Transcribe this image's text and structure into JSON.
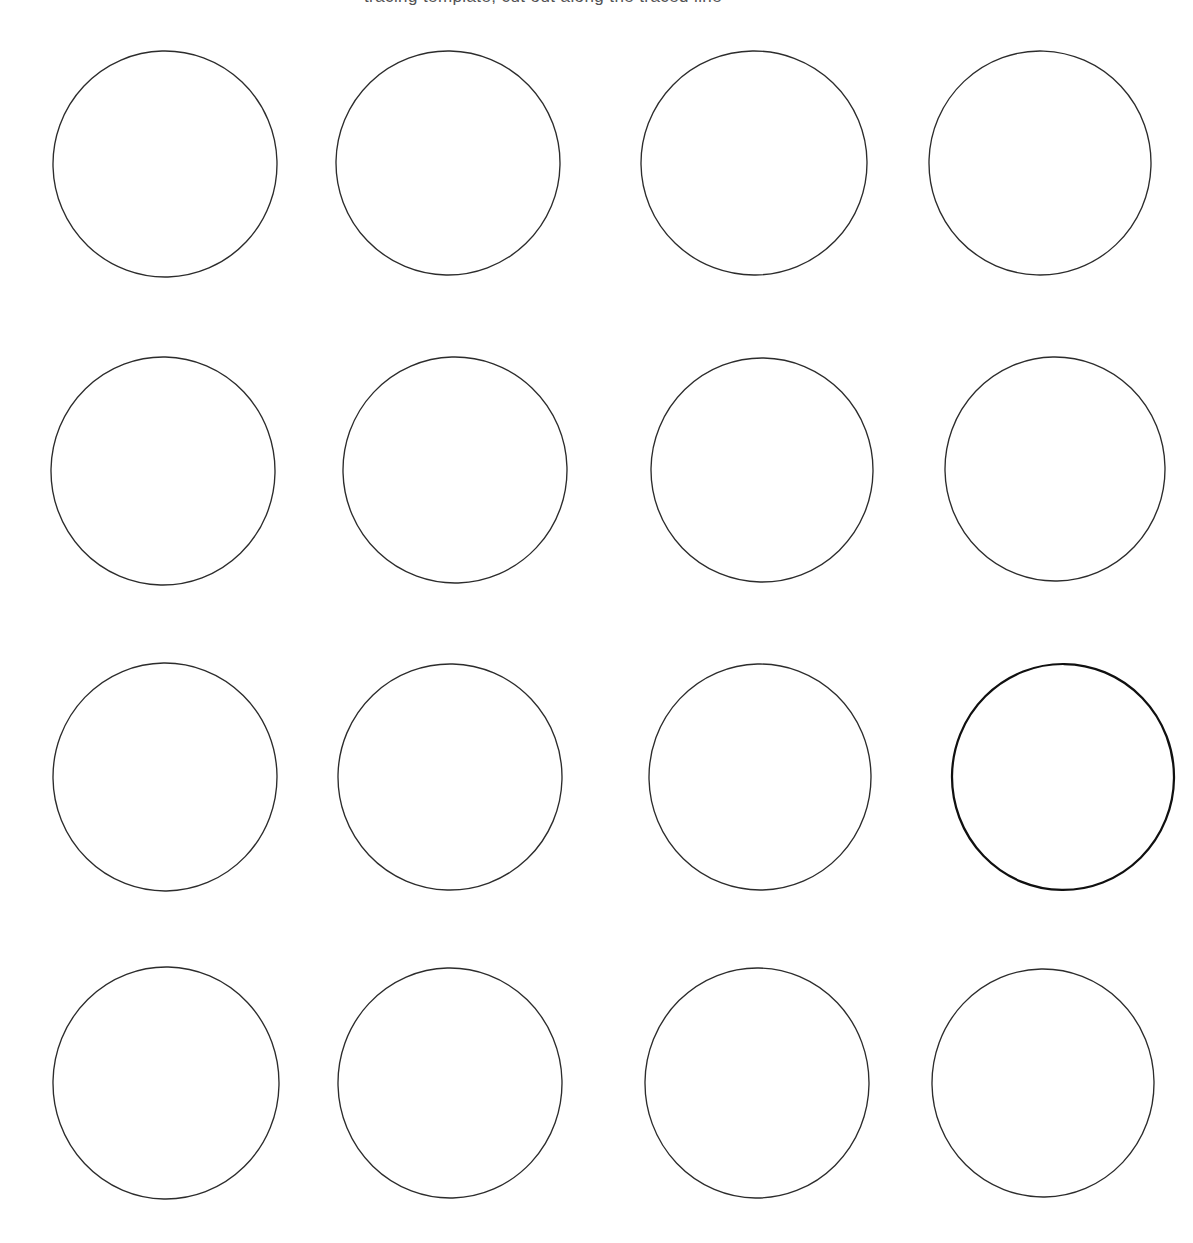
{
  "page": {
    "width": 1193,
    "height": 1243,
    "background_color": "#ffffff",
    "medium": "scanned printed worksheet"
  },
  "header": {
    "title_text": "tracing template, cut out along the traced line",
    "title_visible": "cropped at top edge of page; only descender fragments legible",
    "title_color": "#3a3a3c",
    "title_left_px": 364,
    "title_baseline_clipped": true
  },
  "grid": {
    "label": "circle grid",
    "rows": 4,
    "columns": 4,
    "total_circles": 16,
    "nominal_diameter_px": 225,
    "stroke_color": "#2c2c2c",
    "stroke_width_px": 1.35,
    "emphasized_stroke_color": "#101010",
    "emphasized_stroke_width_px": 2.25,
    "fill": "none",
    "row_centers_y": [
      165,
      471,
      777,
      1083
    ],
    "column_centers_x": [
      165,
      450,
      757,
      1046
    ]
  },
  "circles": [
    {
      "id": "r1c1",
      "row": 1,
      "col": 1,
      "cx": 165,
      "cy": 164,
      "rx": 112,
      "ry": 113,
      "rotate": -1.5,
      "emphasized": false
    },
    {
      "id": "r1c2",
      "row": 1,
      "col": 2,
      "cx": 448,
      "cy": 163,
      "rx": 112,
      "ry": 112,
      "rotate": 1.0,
      "emphasized": false
    },
    {
      "id": "r1c3",
      "row": 1,
      "col": 3,
      "cx": 754,
      "cy": 163,
      "rx": 113,
      "ry": 112,
      "rotate": -0.8,
      "emphasized": false
    },
    {
      "id": "r1c4",
      "row": 1,
      "col": 4,
      "cx": 1040,
      "cy": 163,
      "rx": 111,
      "ry": 112,
      "rotate": 1.8,
      "emphasized": false
    },
    {
      "id": "r2c1",
      "row": 2,
      "col": 1,
      "cx": 163,
      "cy": 471,
      "rx": 112,
      "ry": 114,
      "rotate": 1.2,
      "emphasized": false
    },
    {
      "id": "r2c2",
      "row": 2,
      "col": 2,
      "cx": 455,
      "cy": 470,
      "rx": 112,
      "ry": 113,
      "rotate": -1.6,
      "emphasized": false
    },
    {
      "id": "r2c3",
      "row": 2,
      "col": 3,
      "cx": 762,
      "cy": 470,
      "rx": 111,
      "ry": 112,
      "rotate": 0.9,
      "emphasized": false
    },
    {
      "id": "r2c4",
      "row": 2,
      "col": 4,
      "cx": 1055,
      "cy": 469,
      "rx": 110,
      "ry": 112,
      "rotate": -1.1,
      "emphasized": false
    },
    {
      "id": "r3c1",
      "row": 3,
      "col": 1,
      "cx": 165,
      "cy": 777,
      "rx": 112,
      "ry": 114,
      "rotate": -0.7,
      "emphasized": false
    },
    {
      "id": "r3c2",
      "row": 3,
      "col": 2,
      "cx": 450,
      "cy": 777,
      "rx": 112,
      "ry": 113,
      "rotate": 1.4,
      "emphasized": false
    },
    {
      "id": "r3c3",
      "row": 3,
      "col": 3,
      "cx": 760,
      "cy": 777,
      "rx": 111,
      "ry": 113,
      "rotate": -1.3,
      "emphasized": false
    },
    {
      "id": "r3c4",
      "row": 3,
      "col": 4,
      "cx": 1063,
      "cy": 777,
      "rx": 111,
      "ry": 113,
      "rotate": 0.6,
      "emphasized": true
    },
    {
      "id": "r4c1",
      "row": 4,
      "col": 1,
      "cx": 166,
      "cy": 1083,
      "rx": 113,
      "ry": 116,
      "rotate": 1.1,
      "emphasized": false
    },
    {
      "id": "r4c2",
      "row": 4,
      "col": 2,
      "cx": 450,
      "cy": 1083,
      "rx": 112,
      "ry": 115,
      "rotate": -1.4,
      "emphasized": false
    },
    {
      "id": "r4c3",
      "row": 4,
      "col": 3,
      "cx": 757,
      "cy": 1083,
      "rx": 112,
      "ry": 115,
      "rotate": 0.8,
      "emphasized": false
    },
    {
      "id": "r4c4",
      "row": 4,
      "col": 4,
      "cx": 1043,
      "cy": 1083,
      "rx": 111,
      "ry": 114,
      "rotate": -0.9,
      "emphasized": false
    }
  ]
}
